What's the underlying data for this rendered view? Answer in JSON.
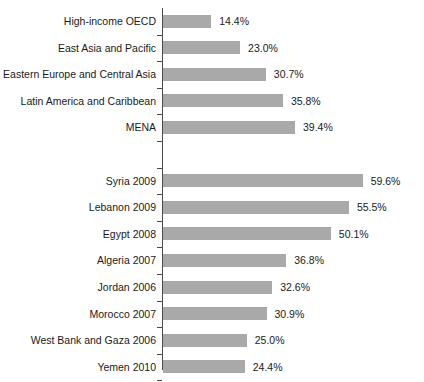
{
  "chart_data": {
    "type": "bar",
    "orientation": "horizontal",
    "title": "",
    "subtitle": "",
    "xlabel": "",
    "ylabel": "",
    "xlim": [
      0,
      62
    ],
    "grid": false,
    "legend": null,
    "value_suffix": "%",
    "categories": [
      "High-income OECD",
      "East Asia and Pacific",
      "Eastern Europe and Central Asia",
      "Latin America and Caribbean",
      "MENA",
      "",
      "Syria 2009",
      "Lebanon 2009",
      "Egypt 2008",
      "Algeria 2007",
      "Jordan 2006",
      "Morocco 2007",
      "West Bank and Gaza 2006",
      "Yemen 2010"
    ],
    "values": [
      14.4,
      23.0,
      30.7,
      35.8,
      39.4,
      null,
      59.6,
      55.5,
      50.1,
      36.8,
      32.6,
      30.9,
      25.0,
      24.4
    ],
    "data_labels": [
      "14.4%",
      "23.0%",
      "30.7%",
      "35.8%",
      "39.4%",
      "",
      "59.6%",
      "55.5%",
      "50.1%",
      "36.8%",
      "32.6%",
      "30.9%",
      "25.0%",
      "24.4%"
    ],
    "bar_color": "#a9a9a9",
    "axis_color": "#4a4a4a",
    "text_color": "#1a1a1a",
    "background_color": "#ffffff"
  }
}
